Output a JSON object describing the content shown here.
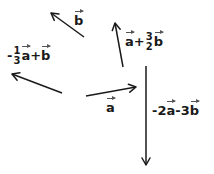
{
  "diagram": {
    "type": "vector-diagram",
    "stroke_color": "#1a1a1a",
    "background": "#ffffff",
    "vectors": [
      {
        "id": "b",
        "label": "b",
        "tail": [
          84,
          37
        ],
        "head": [
          50,
          12
        ]
      },
      {
        "id": "neg_third_a_plus_b",
        "label": "-1/3 a + b",
        "tail": [
          62,
          93
        ],
        "head": [
          11,
          73
        ]
      },
      {
        "id": "a",
        "label": "a",
        "tail": [
          86,
          96
        ],
        "head": [
          137,
          86
        ]
      },
      {
        "id": "a_plus_three_halves_b",
        "label": "a + 3/2 b",
        "tail": [
          123,
          67
        ],
        "head": [
          115,
          22
        ]
      },
      {
        "id": "neg_two_a_minus_three_b",
        "label": "-2a - 3b",
        "tail": [
          146,
          66
        ],
        "head": [
          146,
          166
        ]
      }
    ],
    "labels": {
      "b": {
        "var": "b"
      },
      "neg_third_a_plus_b": {
        "sign": "-",
        "num": "1",
        "den": "3",
        "var1": "a",
        "op": "+",
        "var2": "b"
      },
      "a": {
        "var": "a"
      },
      "a_plus_three_halves_b": {
        "var1": "a",
        "op": "+",
        "num": "3",
        "den": "2",
        "var2": "b"
      },
      "neg_two_a_minus_three_b": {
        "coef1": "-2",
        "var1": "a",
        "op": "-",
        "coef2": "3",
        "var2": "b"
      }
    }
  }
}
